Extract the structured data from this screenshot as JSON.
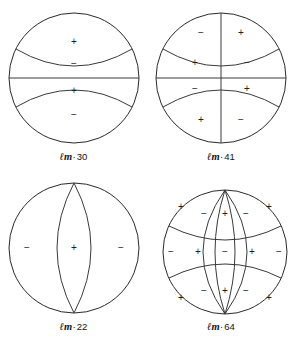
{
  "figure": {
    "stroke_color": "#2a2a2a",
    "background_color": "#ffffff",
    "label_separator": "·",
    "ell_symbol": "ℓ",
    "m_symbol": "m"
  },
  "chart_data": {
    "type": "diagram",
    "title": "",
    "panels": [
      {
        "id": "lm30",
        "label_prefix": "ℓm",
        "label_separator": "·",
        "label_value": "30",
        "label_full": "ℓm · 30",
        "degree_l": 3,
        "order_m": 0,
        "pattern": "zonal",
        "meridian_count": 0,
        "latitude_count": 3,
        "regions": [
          {
            "sign": "+",
            "x": 74,
            "y": 42
          },
          {
            "sign": "−",
            "x": 74,
            "y": 64
          },
          {
            "sign": "+",
            "x": 74,
            "y": 91
          },
          {
            "sign": "−",
            "x": 74,
            "y": 115
          }
        ]
      },
      {
        "id": "lm41",
        "label_prefix": "ℓm",
        "label_separator": "·",
        "label_value": "41",
        "label_full": "ℓm · 41",
        "degree_l": 4,
        "order_m": 1,
        "pattern": "tesseral",
        "meridian_count": 1,
        "latitude_count": 3,
        "regions": [
          {
            "sign": "−",
            "x": 54,
            "y": 33
          },
          {
            "sign": "+",
            "x": 94,
            "y": 33
          },
          {
            "sign": "+",
            "x": 48,
            "y": 63
          },
          {
            "sign": "−",
            "x": 100,
            "y": 63
          },
          {
            "sign": "−",
            "x": 48,
            "y": 89
          },
          {
            "sign": "+",
            "x": 100,
            "y": 89
          },
          {
            "sign": "+",
            "x": 54,
            "y": 120
          },
          {
            "sign": "−",
            "x": 94,
            "y": 120
          }
        ]
      },
      {
        "id": "lm22",
        "label_prefix": "ℓm",
        "label_separator": "·",
        "label_value": "22",
        "label_full": "ℓm · 22",
        "degree_l": 2,
        "order_m": 2,
        "pattern": "sectoral",
        "meridian_count": 2,
        "latitude_count": 0,
        "regions": [
          {
            "sign": "−",
            "x": 27,
            "y": 78
          },
          {
            "sign": "+",
            "x": 74,
            "y": 78
          },
          {
            "sign": "−",
            "x": 121,
            "y": 78
          }
        ]
      },
      {
        "id": "lm64",
        "label_prefix": "ℓm",
        "label_separator": "·",
        "label_value": "64",
        "label_full": "ℓm · 64",
        "degree_l": 6,
        "order_m": 4,
        "pattern": "tesseral",
        "meridian_count": 4,
        "latitude_count": 2,
        "regions": [
          {
            "sign": "+",
            "x": 34,
            "y": 37
          },
          {
            "sign": "−",
            "x": 57,
            "y": 44
          },
          {
            "sign": "+",
            "x": 78,
            "y": 44
          },
          {
            "sign": "−",
            "x": 99,
            "y": 44
          },
          {
            "sign": "+",
            "x": 122,
            "y": 37
          },
          {
            "sign": "−",
            "x": 24,
            "y": 82
          },
          {
            "sign": "+",
            "x": 51,
            "y": 82
          },
          {
            "sign": "−",
            "x": 78,
            "y": 82
          },
          {
            "sign": "+",
            "x": 105,
            "y": 82
          },
          {
            "sign": "−",
            "x": 132,
            "y": 82
          },
          {
            "sign": "+",
            "x": 34,
            "y": 128
          },
          {
            "sign": "−",
            "x": 57,
            "y": 121
          },
          {
            "sign": "+",
            "x": 78,
            "y": 121
          },
          {
            "sign": "−",
            "x": 99,
            "y": 121
          },
          {
            "sign": "+",
            "x": 122,
            "y": 128
          }
        ]
      }
    ]
  }
}
